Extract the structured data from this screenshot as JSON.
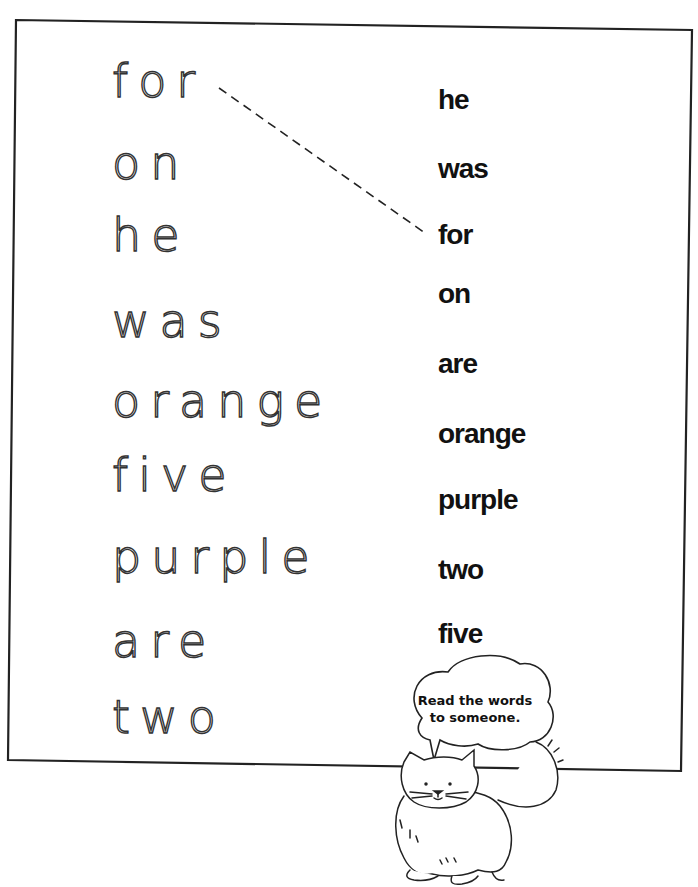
{
  "worksheet": {
    "left_words": [
      {
        "word": "for",
        "top": 58
      },
      {
        "word": "on",
        "top": 140
      },
      {
        "word": "he",
        "top": 212
      },
      {
        "word": "was",
        "top": 298
      },
      {
        "word": "orange",
        "top": 378
      },
      {
        "word": "five",
        "top": 452
      },
      {
        "word": "purple",
        "top": 534
      },
      {
        "word": "are",
        "top": 618
      },
      {
        "word": "two",
        "top": 694
      }
    ],
    "right_words": [
      {
        "word": "he",
        "top": 86
      },
      {
        "word": "was",
        "top": 155
      },
      {
        "word": "for",
        "top": 221
      },
      {
        "word": "on",
        "top": 280
      },
      {
        "word": "are",
        "top": 350
      },
      {
        "word": "orange",
        "top": 420
      },
      {
        "word": "purple",
        "top": 486
      },
      {
        "word": "two",
        "top": 556
      },
      {
        "word": "five",
        "top": 620
      }
    ],
    "example_match": {
      "from": "for",
      "to": "for"
    },
    "speech_bubble": {
      "line1": "Read the words",
      "line2": "to someone."
    },
    "mascot": "cat-illustration",
    "colors": {
      "ink": "#111111",
      "trace": "#333333",
      "background": "#ffffff"
    }
  }
}
